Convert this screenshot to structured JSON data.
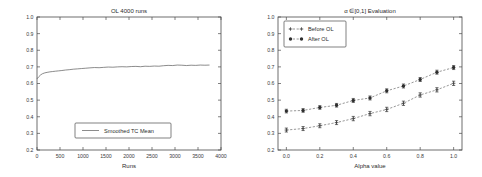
{
  "chart_data": [
    {
      "id": "left",
      "type": "line",
      "title": "OL 4000 runs",
      "xlabel": "Runs",
      "ylabel": "",
      "xlim": [
        0,
        4000
      ],
      "ylim": [
        0.2,
        1.0
      ],
      "xticks": [
        0,
        500,
        1000,
        1500,
        2000,
        2500,
        3000,
        3500,
        4000
      ],
      "xticklabels": [
        "0",
        "500",
        "1000",
        "1500",
        "2000",
        "2500",
        "3000",
        "3500",
        "4000"
      ],
      "yticks": [
        0.2,
        0.3,
        0.4,
        0.5,
        0.6,
        0.7,
        0.8,
        0.9,
        1.0
      ],
      "yticklabels": [
        "0.2",
        "0.3",
        "0.4",
        "0.5",
        "0.6",
        "0.7",
        "0.8",
        "0.9",
        "1.0"
      ],
      "grid": false,
      "legend": {
        "position": "lower-center",
        "entries": [
          {
            "label": "Smoothed TC Mean",
            "marker": "line",
            "color": "#5a5a5a"
          }
        ]
      },
      "series": [
        {
          "name": "Smoothed TC Mean",
          "color": "#5a5a5a",
          "x": [
            0,
            40,
            80,
            120,
            170,
            220,
            280,
            340,
            400,
            470,
            540,
            620,
            700,
            790,
            880,
            970,
            1060,
            1150,
            1250,
            1350,
            1450,
            1550,
            1650,
            1750,
            1850,
            1950,
            2050,
            2150,
            2250,
            2350,
            2450,
            2550,
            2650,
            2750,
            2850,
            2950,
            3050,
            3150,
            3250,
            3350,
            3450,
            3550,
            3650,
            3750
          ],
          "y": [
            0.628,
            0.641,
            0.652,
            0.659,
            0.664,
            0.667,
            0.67,
            0.672,
            0.674,
            0.676,
            0.678,
            0.681,
            0.683,
            0.686,
            0.688,
            0.69,
            0.692,
            0.694,
            0.696,
            0.695,
            0.697,
            0.699,
            0.698,
            0.7,
            0.701,
            0.7,
            0.702,
            0.703,
            0.701,
            0.704,
            0.703,
            0.705,
            0.704,
            0.707,
            0.709,
            0.708,
            0.711,
            0.71,
            0.708,
            0.71,
            0.709,
            0.711,
            0.71,
            0.711
          ]
        }
      ]
    },
    {
      "id": "right",
      "type": "line",
      "title": "α ∈[0,1] Evaluation",
      "xlabel": "Alpha value",
      "ylabel": "",
      "xlim": [
        -0.05,
        1.05
      ],
      "ylim": [
        0.2,
        1.0
      ],
      "xticks": [
        0.0,
        0.2,
        0.4,
        0.6,
        0.8,
        1.0
      ],
      "xticklabels": [
        "0.0",
        "0.2",
        "0.4",
        "0.6",
        "0.8",
        "1.0"
      ],
      "yticks": [
        0.2,
        0.3,
        0.4,
        0.5,
        0.6,
        0.7,
        0.8,
        0.9,
        1.0
      ],
      "yticklabels": [
        "0.2",
        "0.3",
        "0.4",
        "0.5",
        "0.6",
        "0.7",
        "0.8",
        "0.9",
        "1.0"
      ],
      "grid": false,
      "linestyle": "dashed",
      "legend": {
        "position": "upper-left",
        "entries": [
          {
            "label": "Before OL",
            "marker": "plus",
            "color": "#3a3a3a"
          },
          {
            "label": "After OL",
            "marker": "circle",
            "color": "#2e2e2e"
          }
        ]
      },
      "categories": [
        0.0,
        0.1,
        0.2,
        0.3,
        0.4,
        0.5,
        0.6,
        0.7,
        0.8,
        0.9,
        1.0
      ],
      "series": [
        {
          "name": "Before OL",
          "marker": "plus",
          "color": "#3a3a3a",
          "values": [
            0.32,
            0.329,
            0.346,
            0.365,
            0.389,
            0.419,
            0.444,
            0.481,
            0.531,
            0.562,
            0.601
          ],
          "errors": [
            0.012,
            0.012,
            0.012,
            0.012,
            0.013,
            0.013,
            0.013,
            0.013,
            0.013,
            0.013,
            0.013
          ]
        },
        {
          "name": "After OL",
          "marker": "circle",
          "color": "#2e2e2e",
          "values": [
            0.434,
            0.438,
            0.456,
            0.469,
            0.498,
            0.513,
            0.556,
            0.585,
            0.624,
            0.668,
            0.696
          ],
          "errors": [
            0.011,
            0.011,
            0.011,
            0.011,
            0.012,
            0.012,
            0.012,
            0.012,
            0.012,
            0.012,
            0.012
          ]
        }
      ]
    }
  ]
}
